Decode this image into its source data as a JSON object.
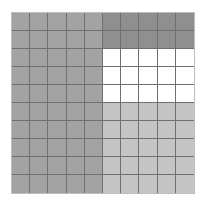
{
  "diagram": {
    "type": "area-model-grid",
    "rows": 10,
    "cols": 10,
    "regions": [
      {
        "name": "left-half",
        "rows": [
          1,
          10
        ],
        "cols": [
          1,
          5
        ],
        "color": "#a3a3a3"
      },
      {
        "name": "top-right",
        "rows": [
          1,
          2
        ],
        "cols": [
          6,
          10
        ],
        "color": "#8f8f8f"
      },
      {
        "name": "middle-right",
        "rows": [
          3,
          5
        ],
        "cols": [
          6,
          10
        ],
        "color": "#ffffff"
      },
      {
        "name": "bottom-right",
        "rows": [
          6,
          10
        ],
        "cols": [
          6,
          10
        ],
        "color": "#c4c4c4"
      }
    ],
    "line_color": "#707070"
  }
}
